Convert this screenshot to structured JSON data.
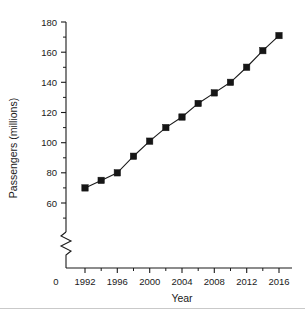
{
  "chart_data": {
    "type": "line",
    "title": "",
    "xlabel": "Year",
    "ylabel": "Passengers (millions)",
    "x": [
      1992,
      1994,
      1996,
      1998,
      2000,
      2002,
      2004,
      2006,
      2008,
      2010,
      2012,
      2014,
      2016
    ],
    "values": [
      70,
      75,
      80,
      91,
      101,
      110,
      117,
      126,
      133,
      140,
      150,
      161,
      171
    ],
    "series": [
      {
        "name": "Passengers",
        "values": [
          70,
          75,
          80,
          91,
          101,
          110,
          117,
          126,
          133,
          140,
          150,
          161,
          171
        ]
      }
    ],
    "xlim": [
      1991,
      2017
    ],
    "ylim": [
      55,
      185
    ],
    "x_ticks": [
      1992,
      1996,
      2000,
      2004,
      2008,
      2012,
      2016
    ],
    "x_tick_labels": [
      "1992",
      "1996",
      "2000",
      "2004",
      "2008",
      "2012",
      "2016"
    ],
    "x_minor_ticks": [
      1994,
      1998,
      2002,
      2006,
      2010,
      2014
    ],
    "y_ticks": [
      60,
      80,
      100,
      120,
      140,
      160,
      180
    ],
    "y_tick_labels": [
      "60",
      "80",
      "100",
      "120",
      "140",
      "160",
      "180"
    ],
    "y_minor_ticks": [
      70,
      90,
      110,
      130,
      150,
      170
    ],
    "origin_label": "0",
    "axis_break": true,
    "grid": false,
    "legend": false,
    "marker_style": "filled-square",
    "line_color": "#1a1a1a",
    "marker_color": "#161616"
  },
  "axis": {
    "y_label": "Passengers (millions)",
    "x_label": "Year",
    "origin": "0"
  },
  "y_labels": {
    "t180": "180",
    "t160": "160",
    "t140": "140",
    "t120": "120",
    "t100": "100",
    "t80": "80",
    "t60": "60"
  },
  "x_labels": {
    "t1992": "1992",
    "t1996": "1996",
    "t2000": "2000",
    "t2004": "2004",
    "t2008": "2008",
    "t2012": "2012",
    "t2016": "2016"
  }
}
